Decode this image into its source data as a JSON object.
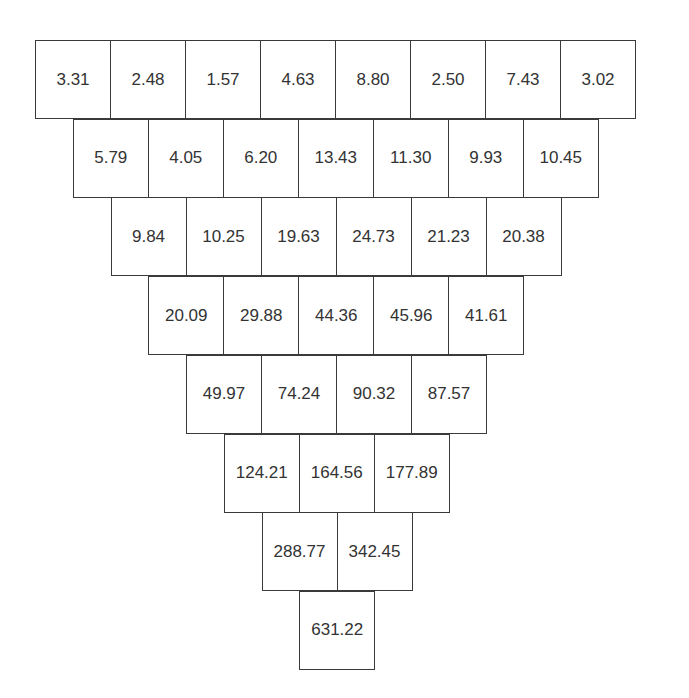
{
  "diagram": {
    "type": "inverted-number-pyramid",
    "rows": [
      [
        "3.31",
        "2.48",
        "1.57",
        "4.63",
        "8.80",
        "2.50",
        "7.43",
        "3.02"
      ],
      [
        "5.79",
        "4.05",
        "6.20",
        "13.43",
        "11.30",
        "9.93",
        "10.45"
      ],
      [
        "9.84",
        "10.25",
        "19.63",
        "24.73",
        "21.23",
        "20.38"
      ],
      [
        "20.09",
        "29.88",
        "44.36",
        "45.96",
        "41.61"
      ],
      [
        "49.97",
        "74.24",
        "90.32",
        "87.57"
      ],
      [
        "124.21",
        "164.56",
        "177.89"
      ],
      [
        "288.77",
        "342.45"
      ],
      [
        "631.22"
      ]
    ],
    "colors": {
      "border": "#3a3a3a",
      "text": "#333333",
      "background": "#ffffff"
    }
  }
}
